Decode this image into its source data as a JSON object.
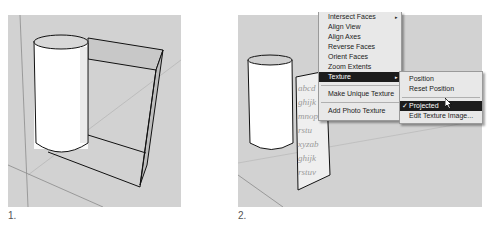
{
  "figures": [
    {
      "caption": "1."
    },
    {
      "caption": "2."
    }
  ],
  "context_menu": {
    "items": [
      {
        "label": "Intersect Faces",
        "submenu": true
      },
      {
        "label": "Align View"
      },
      {
        "label": "Align Axes"
      },
      {
        "label": "Reverse Faces"
      },
      {
        "label": "Orient Faces"
      },
      {
        "label": "Zoom Extents"
      },
      {
        "label": "Texture",
        "submenu": true,
        "highlighted": true
      },
      {
        "label": "Make Unique Texture"
      },
      {
        "label": "Add Photo Texture"
      }
    ],
    "submenu_arrow": "▸"
  },
  "texture_submenu": {
    "items": [
      {
        "label": "Position"
      },
      {
        "label": "Reset Position"
      },
      {
        "label": "Projected",
        "checked": true,
        "highlighted": true
      },
      {
        "label": "Edit Texture Image..."
      }
    ],
    "check_glyph": "✓"
  },
  "icons": {
    "cursor": "mouse-pointer-icon"
  },
  "colors": {
    "viewport_bg": "#d2d2d2",
    "menu_bg": "#e8e8e8",
    "highlight": "#1c1c1c"
  }
}
